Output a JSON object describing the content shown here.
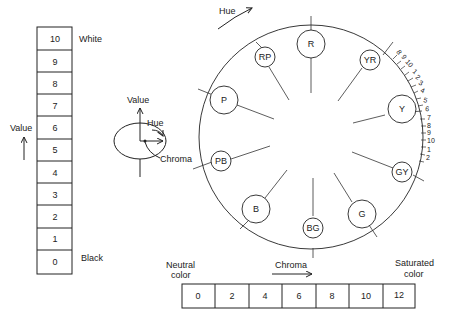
{
  "value_scale": {
    "axis_label": "Value",
    "top_label": "White",
    "bottom_label": "Black",
    "cells": [
      "10",
      "9",
      "8",
      "7",
      "6",
      "5",
      "4",
      "3",
      "2",
      "1",
      "0"
    ]
  },
  "solid_icon": {
    "value_label": "Value",
    "hue_label": "Hue",
    "chroma_label": "Chroma"
  },
  "hue_circle": {
    "hue_label": "Hue",
    "hues": [
      "R",
      "YR",
      "Y",
      "GY",
      "G",
      "BG",
      "B",
      "PB",
      "P",
      "RP"
    ],
    "scale_ticks": [
      "8",
      "9",
      "10",
      "1",
      "2",
      "3",
      "4",
      "5",
      "6",
      "7",
      "8",
      "9",
      "10",
      "1",
      "2"
    ]
  },
  "chroma_scale": {
    "axis_label": "Chroma",
    "left_label_line1": "Neutral",
    "left_label_line2": "color",
    "right_label_line1": "Saturated",
    "right_label_line2": "color",
    "cells": [
      "0",
      "2",
      "4",
      "6",
      "8",
      "10",
      "12"
    ]
  }
}
